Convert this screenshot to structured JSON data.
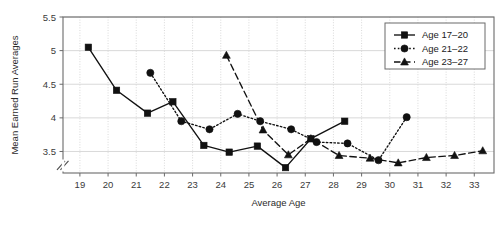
{
  "chart_data": {
    "type": "line",
    "title": "",
    "xlabel": "Average Age",
    "ylabel": "Mean Earned Run Averages",
    "xlim": [
      18.4,
      33.7
    ],
    "ylim": [
      3.18,
      5.5
    ],
    "xticks": [
      19,
      20,
      21,
      22,
      23,
      24,
      25,
      26,
      27,
      28,
      29,
      30,
      31,
      32,
      33
    ],
    "yticks": [
      3.5,
      4,
      4.5,
      5,
      5.5
    ],
    "ytick_labels": [
      "3.5",
      "4",
      "4.5",
      "5",
      "5.5"
    ],
    "grid": true,
    "y_axis_break": true,
    "legend_position": "top-right",
    "series": [
      {
        "name": "Age 17-20",
        "marker": "square",
        "line_style": "solid",
        "color": "#111111",
        "points": [
          {
            "x": 19.3,
            "y": 5.05
          },
          {
            "x": 20.3,
            "y": 4.41
          },
          {
            "x": 21.4,
            "y": 4.07
          },
          {
            "x": 22.3,
            "y": 4.24
          },
          {
            "x": 23.4,
            "y": 3.59
          },
          {
            "x": 24.3,
            "y": 3.49
          },
          {
            "x": 25.3,
            "y": 3.58
          },
          {
            "x": 26.3,
            "y": 3.26
          },
          {
            "x": 27.2,
            "y": 3.69
          },
          {
            "x": 28.4,
            "y": 3.95
          }
        ]
      },
      {
        "name": "Age 21-22",
        "marker": "circle",
        "line_style": "dotted",
        "color": "#111111",
        "points": [
          {
            "x": 21.5,
            "y": 4.67
          },
          {
            "x": 22.6,
            "y": 3.95
          },
          {
            "x": 23.6,
            "y": 3.83
          },
          {
            "x": 24.6,
            "y": 4.06
          },
          {
            "x": 25.4,
            "y": 3.95
          },
          {
            "x": 26.5,
            "y": 3.83
          },
          {
            "x": 27.4,
            "y": 3.64
          },
          {
            "x": 28.5,
            "y": 3.62
          },
          {
            "x": 29.6,
            "y": 3.37
          },
          {
            "x": 30.6,
            "y": 4.01
          }
        ]
      },
      {
        "name": "Age 23-27",
        "marker": "triangle",
        "line_style": "dashed",
        "color": "#111111",
        "points": [
          {
            "x": 24.2,
            "y": 4.93
          },
          {
            "x": 25.5,
            "y": 3.82
          },
          {
            "x": 26.4,
            "y": 3.45
          },
          {
            "x": 27.2,
            "y": 3.69
          },
          {
            "x": 28.2,
            "y": 3.44
          },
          {
            "x": 29.3,
            "y": 3.4
          },
          {
            "x": 30.3,
            "y": 3.33
          },
          {
            "x": 31.3,
            "y": 3.41
          },
          {
            "x": 32.3,
            "y": 3.44
          },
          {
            "x": 33.3,
            "y": 3.51
          }
        ]
      }
    ],
    "legend": [
      {
        "label": "Age 17–20",
        "marker": "square",
        "line_style": "solid"
      },
      {
        "label": "Age 21–22",
        "marker": "circle",
        "line_style": "dotted"
      },
      {
        "label": "Age 23–27",
        "marker": "triangle",
        "line_style": "dashed"
      }
    ]
  }
}
